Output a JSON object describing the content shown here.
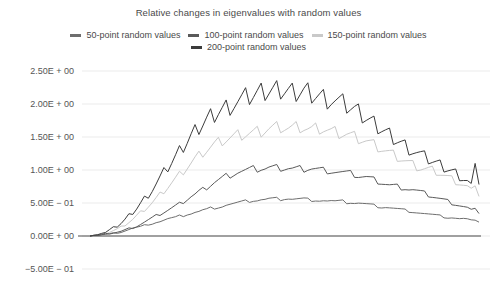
{
  "chart_data": {
    "type": "line",
    "title": "Relative changes in eigenvalues with random values",
    "xlabel": "",
    "ylabel": "",
    "ylim": [
      -0.5,
      2.5
    ],
    "yticks": [
      2.5,
      2.0,
      1.5,
      1.0,
      0.5,
      0.0,
      -0.5
    ],
    "ytick_labels": [
      "2.50E + 00",
      "2.00E + 00",
      "1.50E + 00",
      "1.00E + 00",
      "5.00E − 01",
      "0.00E + 00",
      "−5.00E − 01"
    ],
    "grid": true,
    "grid_axis": "y",
    "legend_position": "top-center",
    "x": [
      0,
      1,
      2,
      3,
      4,
      5,
      6,
      7,
      8,
      9,
      10,
      11,
      12,
      13,
      14,
      15,
      16,
      17,
      18,
      19,
      20,
      21,
      22,
      23,
      24,
      25,
      26,
      27,
      28,
      29,
      30,
      31,
      32,
      33,
      34,
      35,
      36,
      37,
      38,
      39,
      40,
      41,
      42,
      43,
      44,
      45,
      46,
      47,
      48,
      49,
      50,
      51,
      52,
      53,
      54,
      55,
      56,
      57,
      58,
      59,
      60,
      61,
      62,
      63,
      64,
      65,
      66,
      67,
      68,
      69,
      70,
      71,
      72,
      73,
      74,
      75,
      76,
      77,
      78,
      79,
      80,
      81,
      82,
      83,
      84,
      85,
      86,
      87,
      88,
      89,
      90,
      91,
      92,
      93,
      94,
      95,
      96,
      97,
      98,
      99,
      100
    ],
    "series": [
      {
        "name": "50-point random values",
        "color": "#6e6e6e",
        "values": [
          0.0,
          0.01,
          0.01,
          0.02,
          0.02,
          0.03,
          0.04,
          0.05,
          0.06,
          0.08,
          0.1,
          0.12,
          0.13,
          0.14,
          0.16,
          0.18,
          0.19,
          0.21,
          0.22,
          0.24,
          0.26,
          0.27,
          0.28,
          0.3,
          0.31,
          0.33,
          0.34,
          0.36,
          0.37,
          0.39,
          0.4,
          0.42,
          0.43,
          0.44,
          0.45,
          0.47,
          0.48,
          0.49,
          0.5,
          0.51,
          0.52,
          0.53,
          0.54,
          0.54,
          0.55,
          0.55,
          0.56,
          0.56,
          0.56,
          0.56,
          0.57,
          0.57,
          0.56,
          0.56,
          0.56,
          0.56,
          0.55,
          0.55,
          0.55,
          0.54,
          0.54,
          0.53,
          0.53,
          0.52,
          0.52,
          0.52,
          0.51,
          0.51,
          0.5,
          0.5,
          0.49,
          0.48,
          0.47,
          0.46,
          0.45,
          0.44,
          0.44,
          0.43,
          0.42,
          0.41,
          0.4,
          0.39,
          0.38,
          0.37,
          0.36,
          0.35,
          0.34,
          0.33,
          0.32,
          0.31,
          0.3,
          0.29,
          0.28,
          0.28,
          0.27,
          0.26,
          0.26,
          0.25,
          0.23,
          0.24,
          0.21
        ]
      },
      {
        "name": "100-point random values",
        "color": "#5a5a5a",
        "values": [
          0.0,
          0.01,
          0.01,
          0.02,
          0.03,
          0.04,
          0.05,
          0.06,
          0.07,
          0.09,
          0.11,
          0.13,
          0.15,
          0.18,
          0.21,
          0.24,
          0.27,
          0.3,
          0.33,
          0.36,
          0.39,
          0.42,
          0.45,
          0.48,
          0.52,
          0.56,
          0.6,
          0.63,
          0.67,
          0.7,
          0.74,
          0.78,
          0.82,
          0.85,
          0.88,
          0.91,
          0.93,
          0.95,
          0.97,
          0.98,
          0.99,
          1.0,
          1.01,
          1.01,
          1.02,
          1.02,
          1.03,
          1.03,
          1.03,
          1.03,
          1.03,
          1.03,
          1.02,
          1.02,
          1.02,
          1.02,
          1.03,
          1.03,
          1.02,
          1.01,
          1.0,
          1.0,
          0.99,
          0.98,
          0.97,
          0.96,
          0.95,
          0.94,
          0.93,
          0.91,
          0.9,
          0.89,
          0.87,
          0.85,
          0.83,
          0.81,
          0.79,
          0.77,
          0.76,
          0.75,
          0.74,
          0.73,
          0.71,
          0.7,
          0.68,
          0.66,
          0.64,
          0.62,
          0.6,
          0.58,
          0.56,
          0.54,
          0.52,
          0.5,
          0.48,
          0.46,
          0.44,
          0.42,
          0.38,
          0.42,
          0.34
        ]
      },
      {
        "name": "150-point random values",
        "color": "#c9c9c9",
        "values": [
          0.0,
          0.01,
          0.02,
          0.03,
          0.04,
          0.06,
          0.08,
          0.1,
          0.13,
          0.17,
          0.21,
          0.25,
          0.3,
          0.35,
          0.4,
          0.45,
          0.5,
          0.56,
          0.62,
          0.68,
          0.74,
          0.8,
          0.86,
          0.92,
          0.98,
          1.04,
          1.1,
          1.16,
          1.21,
          1.26,
          1.3,
          1.34,
          1.38,
          1.41,
          1.44,
          1.46,
          1.48,
          1.5,
          1.52,
          1.53,
          1.54,
          1.55,
          1.56,
          1.57,
          1.58,
          1.6,
          1.62,
          1.63,
          1.64,
          1.65,
          1.64,
          1.63,
          1.63,
          1.64,
          1.65,
          1.64,
          1.62,
          1.61,
          1.62,
          1.63,
          1.62,
          1.6,
          1.58,
          1.57,
          1.56,
          1.55,
          1.54,
          1.52,
          1.5,
          1.48,
          1.46,
          1.44,
          1.41,
          1.38,
          1.35,
          1.32,
          1.29,
          1.26,
          1.23,
          1.2,
          1.17,
          1.14,
          1.11,
          1.08,
          1.05,
          1.03,
          1.02,
          1.01,
          1.0,
          0.98,
          0.95,
          0.92,
          0.89,
          0.86,
          0.83,
          0.8,
          0.77,
          0.74,
          0.68,
          0.76,
          0.6
        ]
      },
      {
        "name": "200-point random values",
        "color": "#3c3c3c",
        "values": [
          0.0,
          0.01,
          0.02,
          0.04,
          0.06,
          0.09,
          0.12,
          0.16,
          0.2,
          0.25,
          0.31,
          0.37,
          0.43,
          0.5,
          0.57,
          0.64,
          0.71,
          0.79,
          0.87,
          0.95,
          1.03,
          1.11,
          1.19,
          1.27,
          1.35,
          1.43,
          1.51,
          1.58,
          1.65,
          1.71,
          1.77,
          1.82,
          1.86,
          1.9,
          1.93,
          1.96,
          1.99,
          2.01,
          2.03,
          2.05,
          2.07,
          2.09,
          2.11,
          2.13,
          2.15,
          2.17,
          2.18,
          2.19,
          2.2,
          2.21,
          2.2,
          2.19,
          2.18,
          2.19,
          2.2,
          2.21,
          2.2,
          2.18,
          2.16,
          2.14,
          2.12,
          2.1,
          2.08,
          2.05,
          2.02,
          1.99,
          1.96,
          1.93,
          1.9,
          1.86,
          1.82,
          1.78,
          1.74,
          1.7,
          1.66,
          1.62,
          1.58,
          1.54,
          1.5,
          1.46,
          1.42,
          1.38,
          1.34,
          1.3,
          1.26,
          1.22,
          1.18,
          1.15,
          1.12,
          1.09,
          1.06,
          1.03,
          1.0,
          0.97,
          0.94,
          0.9,
          0.86,
          0.82,
          0.74,
          1.1,
          0.78
        ]
      }
    ]
  },
  "legend": {
    "rows": [
      [
        {
          "label": "50-point random values",
          "color": "#6e6e6e"
        },
        {
          "label": "100-point random values",
          "color": "#5a5a5a"
        },
        {
          "label": "150-point random values",
          "color": "#c9c9c9"
        }
      ],
      [
        {
          "label": "200-point random values",
          "color": "#3c3c3c"
        }
      ]
    ]
  },
  "colors": {
    "background": "#ffffff",
    "grid": "#ebebeb",
    "zero_line": "#4d4d4d",
    "text": "#4a4a4a"
  }
}
